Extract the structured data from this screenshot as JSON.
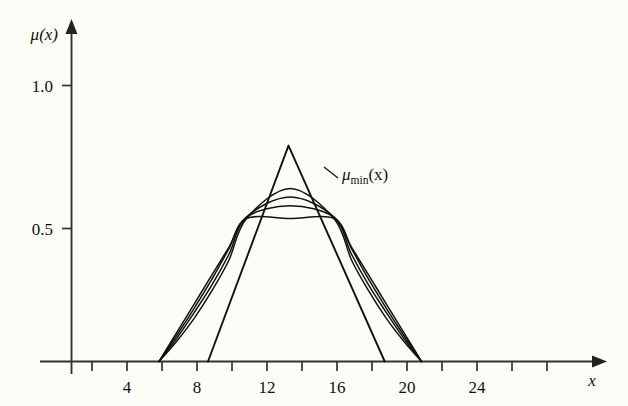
{
  "chart_data": {
    "type": "line",
    "title": "",
    "subtitle": "",
    "xlabel": "x",
    "ylabel": "μ(x)",
    "xlim": [
      0,
      26.5
    ],
    "ylim": [
      0,
      1.18
    ],
    "grid": false,
    "legend": "none",
    "background_color": "#fdfdf7",
    "line_color": "#111111",
    "xticks": [
      2,
      4,
      6,
      8,
      10,
      12,
      14,
      16,
      18,
      20,
      22,
      24,
      26
    ],
    "xtick_labels": [
      "",
      "4",
      "",
      "8",
      "",
      "12",
      "",
      "16",
      "",
      "20",
      "",
      "24",
      ""
    ],
    "yticks": [
      0.5,
      1.0
    ],
    "ytick_labels": [
      "0.5",
      "1.0"
    ],
    "annotations": [
      {
        "name": "mu-min-label",
        "text": "μ",
        "subscript": "min",
        "suffix": "(x)",
        "full_text": "μ_min(x)",
        "x": 13.0,
        "y": 0.7,
        "leader_from": [
          12.85,
          0.665
        ],
        "leader_to": [
          12.35,
          0.715
        ]
      }
    ],
    "series": [
      {
        "name": "mu_min",
        "description": "piecewise-linear minimum membership triangle",
        "x": [
          7.8,
          12.4,
          17.9
        ],
        "values": [
          0.0,
          0.755,
          0.0
        ]
      },
      {
        "name": "mean_family_p1",
        "description": "generalized-mean aggregation curve, plateau at 0.5",
        "x": [
          5.0,
          6.0,
          7.0,
          8.0,
          9.0,
          10.0,
          12.5,
          15.0,
          16.0,
          17.0,
          18.0,
          19.0,
          20.0
        ],
        "values": [
          0.0,
          0.1,
          0.2,
          0.3,
          0.4,
          0.5,
          0.5,
          0.5,
          0.4,
          0.3,
          0.2,
          0.1,
          0.0
        ]
      },
      {
        "name": "mean_family_p2",
        "description": "convex aggregation curve peaking near 0.545",
        "x": [
          5.0,
          6.0,
          7.0,
          8.0,
          9.0,
          10.0,
          12.5,
          15.0,
          16.0,
          17.0,
          18.0,
          19.0,
          20.0
        ],
        "values": [
          0.0,
          0.09,
          0.185,
          0.285,
          0.395,
          0.505,
          0.545,
          0.505,
          0.395,
          0.285,
          0.185,
          0.09,
          0.0
        ]
      },
      {
        "name": "mean_family_p3",
        "description": "convex aggregation curve peaking near 0.575",
        "x": [
          5.0,
          6.0,
          7.0,
          8.0,
          9.0,
          10.0,
          12.5,
          15.0,
          16.0,
          17.0,
          18.0,
          19.0,
          20.0
        ],
        "values": [
          0.0,
          0.08,
          0.17,
          0.265,
          0.375,
          0.505,
          0.575,
          0.505,
          0.375,
          0.265,
          0.17,
          0.08,
          0.0
        ]
      },
      {
        "name": "mean_family_p4",
        "description": "convex aggregation curve peaking near 0.605",
        "x": [
          5.0,
          6.0,
          7.0,
          8.0,
          9.0,
          10.0,
          12.5,
          15.0,
          16.0,
          17.0,
          18.0,
          19.0,
          20.0
        ],
        "values": [
          0.0,
          0.07,
          0.15,
          0.245,
          0.355,
          0.5,
          0.605,
          0.5,
          0.355,
          0.245,
          0.15,
          0.07,
          0.0
        ]
      }
    ]
  }
}
